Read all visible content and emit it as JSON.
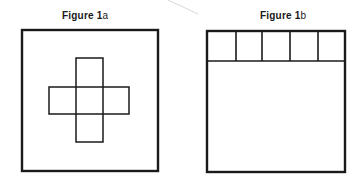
{
  "figures": [
    {
      "id": "1a",
      "caption_prefix": "Figure",
      "caption_number": " 1",
      "caption_suffix": "a",
      "description": "Square frame containing a plus-shaped cross of five squares",
      "frame": {
        "x": 22,
        "y": 30,
        "w": 136,
        "h": 141
      },
      "cross": {
        "vertical": {
          "x": 76,
          "y": 58,
          "w": 27,
          "h": 84
        },
        "horizontal": {
          "x": 49,
          "y": 87,
          "w": 80,
          "h": 27
        }
      }
    },
    {
      "id": "1b",
      "caption_prefix": "Figure",
      "caption_number": " 1",
      "caption_suffix": "b",
      "description": "Square frame with a row of five squares along the top edge",
      "frame": {
        "x": 207,
        "y": 31,
        "w": 138,
        "h": 141
      },
      "top_row": {
        "y": 31,
        "h": 30,
        "dividers_x": [
          236,
          262,
          290,
          318
        ],
        "cell_count": 5
      }
    }
  ],
  "colors": {
    "stroke": "#1a1a1a",
    "background": "#ffffff",
    "artifact": "#d8d8d8"
  }
}
